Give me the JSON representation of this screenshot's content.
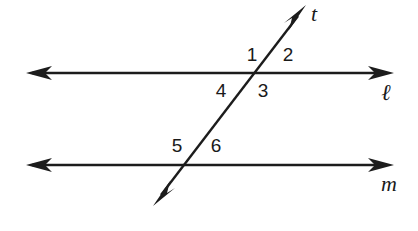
{
  "diagram": {
    "type": "geometry-parallel-lines-transversal",
    "background_color": "#ffffff",
    "stroke_color": "#1c1c1c",
    "text_color": "#1a1a1a",
    "lines": [
      {
        "id": "line-l",
        "label": "ℓ",
        "role": "parallel-line-top",
        "x1": 28,
        "y1": 73,
        "x2": 392,
        "y2": 73,
        "arrows": "both",
        "label_x": 386,
        "label_y": 94
      },
      {
        "id": "line-m",
        "label": "m",
        "role": "parallel-line-bottom",
        "x1": 28,
        "y1": 165,
        "x2": 392,
        "y2": 165,
        "arrows": "both",
        "label_x": 389,
        "label_y": 186
      },
      {
        "id": "line-t",
        "label": "t",
        "role": "transversal",
        "x1": 155,
        "y1": 203,
        "x2": 304,
        "y2": 8,
        "arrows": "both",
        "label_x": 314,
        "label_y": 16
      }
    ],
    "intersections": [
      {
        "id": "intersection-l-t",
        "x": 259,
        "y": 73
      },
      {
        "id": "intersection-m-t",
        "x": 186,
        "y": 165
      }
    ],
    "angle_labels": [
      {
        "id": "angle-1",
        "text": "1",
        "x": 252,
        "y": 56,
        "position": "upper-left-at-line-l"
      },
      {
        "id": "angle-2",
        "text": "2",
        "x": 288,
        "y": 56,
        "position": "upper-right-at-line-l"
      },
      {
        "id": "angle-3",
        "text": "3",
        "x": 263,
        "y": 92,
        "position": "lower-right-at-line-l"
      },
      {
        "id": "angle-4",
        "text": "4",
        "x": 221,
        "y": 92,
        "position": "lower-left-at-line-l"
      },
      {
        "id": "angle-5",
        "text": "5",
        "x": 177,
        "y": 147,
        "position": "upper-left-at-line-m"
      },
      {
        "id": "angle-6",
        "text": "6",
        "x": 216,
        "y": 147,
        "position": "upper-right-at-line-m"
      }
    ]
  }
}
